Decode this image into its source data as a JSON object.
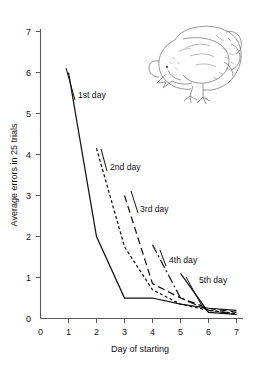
{
  "figure": {
    "caption_present": false,
    "background_color": "#ffffff",
    "ink_color": "#111111",
    "axis_color": "#5a5a5a"
  },
  "illustration": {
    "name": "pecking-chick",
    "description": "line drawing of a young chick bending down pecking at the ground"
  },
  "chart_data": {
    "type": "line",
    "title": "",
    "xlabel": "Day of starting",
    "ylabel": "Average errors in 25 trials",
    "xlim": [
      0,
      7
    ],
    "ylim": [
      0,
      7
    ],
    "xticks": [
      0,
      1,
      2,
      3,
      4,
      5,
      6,
      7
    ],
    "yticks": [
      0,
      1,
      2,
      3,
      4,
      5,
      6,
      7
    ],
    "xticklabels": [
      "0",
      "1",
      "2",
      "3",
      "4",
      "5",
      "6",
      "7"
    ],
    "yticklabels": [
      "0",
      "1",
      "2",
      "3",
      "4",
      "5",
      "6",
      "7"
    ],
    "grid": false,
    "legend_position": "inline-annotations",
    "series": [
      {
        "name": "1st day",
        "label": "1st day",
        "linestyle": "solid",
        "dasharray": "",
        "x": [
          1,
          2,
          3,
          4,
          5,
          6,
          7
        ],
        "y": [
          6.0,
          2.0,
          0.5,
          0.5,
          0.35,
          0.25,
          0.2
        ]
      },
      {
        "name": "2nd day",
        "label": "2nd day",
        "linestyle": "short-dash",
        "dasharray": "3,2.4",
        "x": [
          2,
          3,
          4,
          5,
          6,
          7
        ],
        "y": [
          4.15,
          1.75,
          0.7,
          0.35,
          0.2,
          0.12
        ]
      },
      {
        "name": "3rd day",
        "label": "3rd day",
        "linestyle": "long-dash",
        "dasharray": "7,4",
        "x": [
          3,
          4,
          5,
          6,
          7
        ],
        "y": [
          3.0,
          0.85,
          0.5,
          0.25,
          0.15
        ]
      },
      {
        "name": "4th day",
        "label": "4th day",
        "linestyle": "dash-dot",
        "dasharray": "9,3,2,3",
        "x": [
          4,
          5,
          6,
          7
        ],
        "y": [
          1.8,
          0.5,
          0.2,
          0.1
        ]
      },
      {
        "name": "5th day",
        "label": "5th day",
        "linestyle": "solid",
        "dasharray": "",
        "x": [
          5,
          6,
          7
        ],
        "y": [
          1.1,
          0.15,
          0.1
        ]
      }
    ],
    "annotations": [
      {
        "text": "1st day",
        "x": 1.35,
        "y": 5.45
      },
      {
        "text": "2nd day",
        "x": 2.45,
        "y": 3.95
      },
      {
        "text": "3rd day",
        "x": 3.45,
        "y": 2.78
      },
      {
        "text": "4th day",
        "x": 4.42,
        "y": 1.72
      },
      {
        "text": "5th day",
        "x": 5.45,
        "y": 1.05
      }
    ]
  }
}
